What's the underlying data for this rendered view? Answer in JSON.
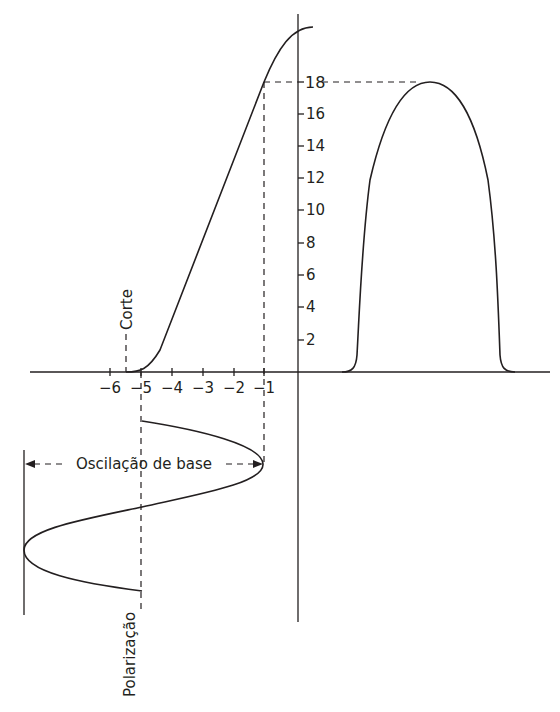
{
  "diagram": {
    "colors": {
      "stroke": "#231f20",
      "background": "#ffffff"
    },
    "labels": {
      "cutoff": "Corte",
      "base_swing": "Oscilação de base",
      "bias": "Polarização"
    },
    "x_axis": {
      "ticks": [
        "−6",
        "−5",
        "−4",
        "−3",
        "−2",
        "−1"
      ],
      "values": [
        -6,
        -5,
        -4,
        -3,
        -2,
        -1
      ]
    },
    "y_axis": {
      "ticks": [
        "2",
        "4",
        "6",
        "8",
        "10",
        "12",
        "14",
        "16",
        "18"
      ],
      "values": [
        2,
        4,
        6,
        8,
        10,
        12,
        14,
        16,
        18
      ]
    },
    "annotations": {
      "cutoff_value": -5.5,
      "bias_value": -5,
      "peak_input_value": -1,
      "peak_output_value": 18
    }
  }
}
